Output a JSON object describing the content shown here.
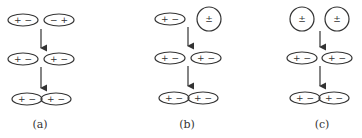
{
  "diagram": {
    "panels": [
      {
        "label": "(a)",
        "rows": [
          [
            {
              "shape": "ellipse",
              "charges": "+ −"
            },
            {
              "shape": "ellipse",
              "charges": "− +"
            }
          ],
          [
            {
              "shape": "ellipse",
              "charges": "+ −"
            },
            {
              "shape": "ellipse",
              "charges": "+ −"
            }
          ],
          [
            {
              "shape": "ellipse-joined",
              "charges": "+ −"
            },
            {
              "shape": "ellipse-joined",
              "charges": "+ −"
            }
          ]
        ]
      },
      {
        "label": "(b)",
        "rows": [
          [
            {
              "shape": "ellipse",
              "charges": "+ −"
            },
            {
              "shape": "circle",
              "charges": "±"
            }
          ],
          [
            {
              "shape": "ellipse",
              "charges": "+ −"
            },
            {
              "shape": "ellipse",
              "charges": "+ −"
            }
          ],
          [
            {
              "shape": "ellipse-joined",
              "charges": "+ −"
            },
            {
              "shape": "ellipse-joined",
              "charges": "+ −"
            }
          ]
        ]
      },
      {
        "label": "(c)",
        "rows": [
          [
            {
              "shape": "circle",
              "charges": "±"
            },
            {
              "shape": "circle",
              "charges": "±"
            }
          ],
          [
            {
              "shape": "ellipse",
              "charges": "+ −"
            },
            {
              "shape": "ellipse",
              "charges": "+ −"
            }
          ],
          [
            {
              "shape": "ellipse-joined",
              "charges": "+ −"
            },
            {
              "shape": "ellipse-joined",
              "charges": "+ −"
            }
          ]
        ]
      }
    ],
    "colors": {
      "stroke": "#333333",
      "background": "#ffffff"
    }
  }
}
